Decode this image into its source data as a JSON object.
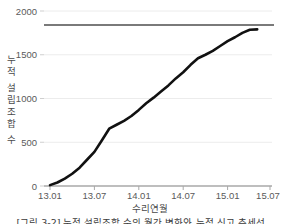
{
  "chart_data": {
    "type": "line",
    "title": "",
    "xlabel": "수리연월",
    "ylabel": "누적 설립조합 수",
    "ylabel_chars": [
      "누",
      "적",
      " ",
      "설",
      "립",
      "조",
      "합",
      " ",
      "수"
    ],
    "ylim": [
      0,
      2000
    ],
    "yticks": [
      0,
      500,
      1000,
      1500,
      2000
    ],
    "ytick_labels": [
      "0",
      "500",
      "1000",
      "1500",
      "2000"
    ],
    "xtick_labels": [
      "13.01",
      "13.07",
      "14.01",
      "14.07",
      "15.01",
      "15.07"
    ],
    "xtick_values": [
      "2013.01",
      "2013.07",
      "2014.01",
      "2014.07",
      "2015.01",
      "2015.07"
    ],
    "xlim": [
      "12.11",
      "15.09"
    ],
    "grid": true,
    "legend": "none",
    "series": [
      {
        "name": "누적 설립조합 수",
        "color": "#111111",
        "x": [
          "13.01",
          "13.02",
          "13.03",
          "13.04",
          "13.05",
          "13.06",
          "13.07",
          "13.08",
          "13.09",
          "13.10",
          "13.11",
          "13.12",
          "14.01",
          "14.02",
          "14.03",
          "14.04",
          "14.05",
          "14.06",
          "14.07",
          "14.08",
          "14.09",
          "14.10",
          "14.11",
          "14.12",
          "15.01",
          "15.02",
          "15.03",
          "15.04",
          "15.05"
        ],
        "values": [
          10,
          40,
          85,
          140,
          210,
          300,
          390,
          520,
          655,
          700,
          745,
          800,
          870,
          945,
          1010,
          1080,
          1150,
          1230,
          1300,
          1385,
          1460,
          1500,
          1545,
          1600,
          1655,
          1700,
          1750,
          1785,
          1790
        ]
      }
    ],
    "reference_line": {
      "name": "목표선",
      "value": 1840,
      "color": "#7a7a7a",
      "orientation": "horizontal"
    },
    "colors": {
      "line": "#111111",
      "reference": "#7a7a7a",
      "grid": "#ececec",
      "axis": "#9a9a9a",
      "text": "#4a4a4a"
    }
  },
  "caption": {
    "text": "[그림 3-2] 누적 설립조합 수의 월간 변화와 누적 신고 추세선"
  }
}
